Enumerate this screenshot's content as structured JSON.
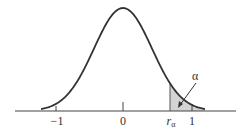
{
  "chart_data": {
    "type": "area",
    "title": "",
    "xlabel": "",
    "ylabel": "",
    "xlim": [
      -1.2,
      1.2
    ],
    "grid": false,
    "legend": null,
    "tick_labels": [
      "−1",
      "0",
      "r_α",
      "1"
    ],
    "ticks": [
      {
        "label": "−1",
        "value": -1
      },
      {
        "label": "0",
        "value": 0
      },
      {
        "label": "r_α",
        "value": 0.7
      },
      {
        "label": "1",
        "value": 1
      }
    ],
    "curve": {
      "peak_x": 0,
      "shape": "bell",
      "support": [
        -1.22,
        1.22
      ]
    },
    "shaded_region": {
      "from": "r_α",
      "to": 1.22,
      "label": "α",
      "color": "#d4d4d4"
    },
    "annotations": [
      {
        "text": "α",
        "points_to": "shaded right tail"
      }
    ]
  },
  "labels": {
    "tick_neg1": "−1",
    "tick_0": "0",
    "tick_r": "r",
    "tick_r_sub": "α",
    "tick_1": "1",
    "alpha": "α"
  },
  "colors": {
    "curve": "#333333",
    "axis": "#444444",
    "shade": "#d4d4d4"
  }
}
